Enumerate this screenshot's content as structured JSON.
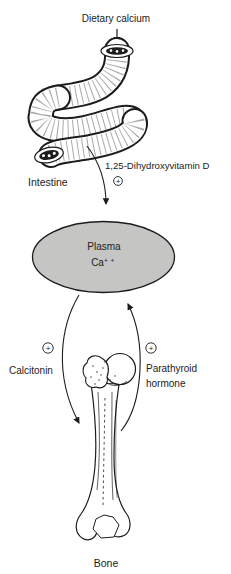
{
  "figure": {
    "ink": "#1c1c1c",
    "background": "#ffffff",
    "labels": {
      "dietary_calcium": "Dietary calcium",
      "intestine": "Intestine",
      "vitamin_d": "1,25-Dihydroxyvitamin D",
      "calcitonin": "Calcitonin",
      "parathyroid_1": "Parathyroid",
      "parathyroid_2": "hormone",
      "bone": "Bone",
      "plus": "+"
    },
    "plasma_node": {
      "line1": "Plasma",
      "line2_base": "Ca",
      "line2_sup": "+ +",
      "fill": "#c5c6c4"
    },
    "edges": [
      {
        "from": "Dietary calcium",
        "to": "Intestine",
        "label": "",
        "effect": ""
      },
      {
        "from": "Intestine",
        "to": "Plasma Ca++",
        "label": "1,25-Dihydroxyvitamin D",
        "effect": "+"
      },
      {
        "from": "Plasma Ca++",
        "to": "Bone",
        "label": "Calcitonin",
        "effect": "+"
      },
      {
        "from": "Bone",
        "to": "Plasma Ca++",
        "label": "Parathyroid hormone",
        "effect": "+"
      }
    ]
  }
}
